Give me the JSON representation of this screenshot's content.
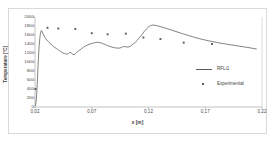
{
  "chart_data": {
    "type": "line",
    "title": "",
    "xlabel": "x [m]",
    "ylabel": "Temperature [°C]",
    "xlim": [
      0.02,
      0.22
    ],
    "ylim": [
      0,
      2000
    ],
    "grid": false,
    "legend_position": "center-right",
    "xticks": [
      "0,02",
      "0,07",
      "0,12",
      "0,17",
      "0,22"
    ],
    "xtick_values": [
      0.02,
      0.07,
      0.12,
      0.17,
      0.22
    ],
    "yticks": [
      "0",
      "200",
      "400",
      "600",
      "800",
      "1000",
      "1200",
      "1400",
      "1600",
      "1800",
      "2000"
    ],
    "ytick_values": [
      0,
      200,
      400,
      600,
      800,
      1000,
      1200,
      1400,
      1600,
      1800,
      2000
    ],
    "series": [
      {
        "name": "RFLi1",
        "type": "line",
        "color": "#4d4d4d",
        "x": [
          0.0205,
          0.0212,
          0.0218,
          0.0224,
          0.023,
          0.0236,
          0.0242,
          0.0248,
          0.0256,
          0.0264,
          0.0272,
          0.028,
          0.029,
          0.03,
          0.031,
          0.032,
          0.033,
          0.034,
          0.0352,
          0.0364,
          0.0376,
          0.0388,
          0.04,
          0.0412,
          0.0424,
          0.0436,
          0.0448,
          0.046,
          0.0472,
          0.0484,
          0.0496,
          0.0508,
          0.052,
          0.0532,
          0.0544,
          0.0556,
          0.0568,
          0.058,
          0.0596,
          0.0612,
          0.0628,
          0.0644,
          0.066,
          0.0676,
          0.0692,
          0.0708,
          0.0724,
          0.074,
          0.0756,
          0.0772,
          0.0788,
          0.0804,
          0.082,
          0.084,
          0.086,
          0.088,
          0.09,
          0.092,
          0.094,
          0.096,
          0.098,
          0.1,
          0.102,
          0.104,
          0.106,
          0.108,
          0.11,
          0.112,
          0.114,
          0.116,
          0.118,
          0.12,
          0.122,
          0.124,
          0.127,
          0.13,
          0.134,
          0.138,
          0.142,
          0.146,
          0.15,
          0.155,
          0.16,
          0.165,
          0.17,
          0.175,
          0.18,
          0.185,
          0.19,
          0.195,
          0.2,
          0.205,
          0.21,
          0.215
        ],
        "y": [
          30,
          180,
          420,
          760,
          1080,
          1340,
          1520,
          1640,
          1700,
          1672,
          1620,
          1580,
          1540,
          1500,
          1470,
          1445,
          1420,
          1400,
          1372,
          1340,
          1320,
          1300,
          1280,
          1255,
          1235,
          1215,
          1200,
          1190,
          1180,
          1172,
          1190,
          1215,
          1200,
          1175,
          1160,
          1185,
          1215,
          1240,
          1270,
          1300,
          1330,
          1355,
          1375,
          1392,
          1405,
          1418,
          1428,
          1435,
          1438,
          1430,
          1418,
          1402,
          1385,
          1365,
          1345,
          1330,
          1318,
          1310,
          1308,
          1320,
          1345,
          1338,
          1330,
          1352,
          1390,
          1430,
          1480,
          1540,
          1605,
          1670,
          1730,
          1780,
          1812,
          1822,
          1810,
          1790,
          1760,
          1728,
          1695,
          1662,
          1630,
          1590,
          1552,
          1518,
          1488,
          1460,
          1435,
          1412,
          1392,
          1372,
          1352,
          1332,
          1312,
          1290
        ]
      },
      {
        "name": "Experimental",
        "type": "scatter",
        "marker": "square",
        "color": "#5a5a5a",
        "x": [
          0.0205,
          0.031,
          0.0405,
          0.0555,
          0.07,
          0.084,
          0.1,
          0.1155,
          0.1305,
          0.151,
          0.176
        ],
        "y": [
          400,
          1760,
          1745,
          1735,
          1640,
          1615,
          1630,
          1545,
          1510,
          1430,
          1400
        ]
      }
    ]
  },
  "legend": {
    "entries": [
      {
        "label": "RFLi1",
        "marker": "line"
      },
      {
        "label": "Experimental",
        "marker": "square"
      }
    ]
  }
}
